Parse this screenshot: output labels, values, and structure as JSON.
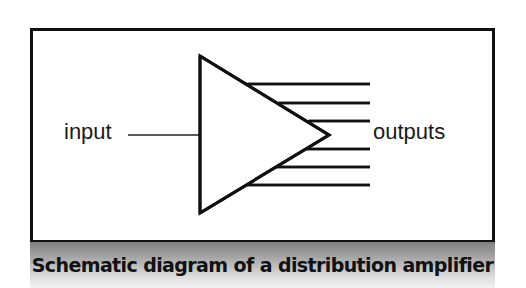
{
  "diagram": {
    "labels": {
      "input": "input",
      "outputs": "outputs"
    },
    "caption": "Schematic diagram of a distribution amplifier",
    "components": [
      {
        "id": "amplifier",
        "shape": "triangle",
        "points": [
          [
            200,
            56
          ],
          [
            200,
            213
          ],
          [
            329,
            135
          ]
        ]
      },
      {
        "id": "input-line",
        "shape": "line",
        "from": [
          128,
          135
        ],
        "to": [
          200,
          135
        ]
      }
    ],
    "output_lines": [
      {
        "y": 84
      },
      {
        "y": 103
      },
      {
        "y": 121
      },
      {
        "y": 149
      },
      {
        "y": 167
      },
      {
        "y": 185
      }
    ],
    "output_count": 6,
    "colors": {
      "stroke": "#111111",
      "background": "#ffffff",
      "caption_gradient_top": "#7f7f7f",
      "caption_gradient_bottom": "#f2f2f2"
    }
  }
}
